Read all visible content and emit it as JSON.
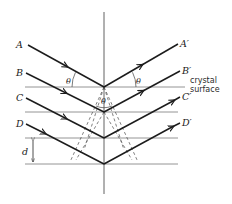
{
  "diagram": {
    "type": "bragg-diffraction",
    "incident_rays": [
      {
        "label": "A",
        "start": [
          28,
          45
        ],
        "end": [
          104,
          87
        ]
      },
      {
        "label": "B",
        "start": [
          26,
          73
        ],
        "end": [
          104,
          112
        ]
      },
      {
        "label": "C",
        "start": [
          26,
          98
        ],
        "end": [
          104,
          138
        ]
      },
      {
        "label": "D",
        "start": [
          26,
          124
        ],
        "end": [
          104,
          164
        ]
      }
    ],
    "reflected_rays": [
      {
        "label": "A'",
        "start": [
          104,
          87
        ],
        "end": [
          178,
          44
        ]
      },
      {
        "label": "B'",
        "start": [
          104,
          112
        ],
        "end": [
          180,
          71
        ]
      },
      {
        "label": "C'",
        "start": [
          104,
          138
        ],
        "end": [
          180,
          97
        ]
      },
      {
        "label": "D'",
        "start": [
          104,
          164
        ],
        "end": [
          180,
          123
        ]
      }
    ],
    "planes_y": [
      87,
      112,
      138,
      164
    ],
    "angle_label": "θ",
    "spacing_label": "d",
    "surface_label_line1": "crystal",
    "surface_label_line2": "surface"
  },
  "labels": {
    "A": "A",
    "B": "B",
    "C": "C",
    "D": "D",
    "A_prime": "A′",
    "B_prime": "B′",
    "C_prime": "C′",
    "D_prime": "D′",
    "theta": "θ",
    "d": "d",
    "crystal": "crystal",
    "surface": "surface"
  }
}
